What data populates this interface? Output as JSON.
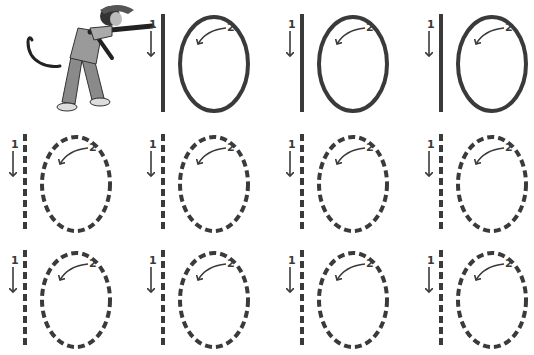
{
  "worksheet": {
    "subject": "Number 10 tracing practice",
    "stroke_color": "#3a3a3a",
    "stroke_labels": {
      "first": "1",
      "second": "2"
    },
    "mascot": "monkey-pointing",
    "rows": [
      {
        "style": "solid",
        "cells": [
          "mascot",
          "10",
          "10",
          "10"
        ]
      },
      {
        "style": "dashed",
        "cells": [
          "10",
          "10",
          "10",
          "10"
        ]
      },
      {
        "style": "dashed",
        "cells": [
          "10",
          "10",
          "10",
          "10"
        ]
      }
    ]
  }
}
